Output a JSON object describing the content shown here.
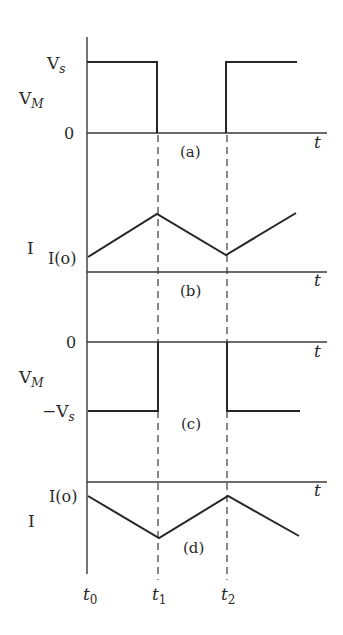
{
  "diagram": {
    "colors": {
      "background": "#ffffff",
      "ink": "#262626"
    },
    "time_markers": [
      {
        "label": "t",
        "sub": "0",
        "x": 88
      },
      {
        "label": "t",
        "sub": "1",
        "x": 158
      },
      {
        "label": "t",
        "sub": "2",
        "x": 227
      }
    ],
    "panels": [
      {
        "id": "a",
        "caption": "(a)",
        "y_label_main": "V",
        "y_label_sub": "M",
        "ticks": [
          {
            "main": "V",
            "sub": "s",
            "y": 62
          },
          {
            "main": "0",
            "sub": "",
            "y": 133
          }
        ],
        "x_axis_label": "t",
        "waveform": "square pulse from 0 to Vs: high on t0–t1, zero on t1–t2, high after t2"
      },
      {
        "id": "b",
        "caption": "(b)",
        "y_label_main": "I",
        "ticks": [
          {
            "main": "I(o)",
            "y": 257
          }
        ],
        "x_axis_label": "t",
        "waveform": "triangular current: rises from I(o) to peak at t1, falls to I(o) at t2, rises again"
      },
      {
        "id": "c",
        "caption": "(c)",
        "y_label_main": "V",
        "y_label_sub": "M",
        "ticks": [
          {
            "main": "0",
            "sub": "",
            "y": 342
          },
          {
            "main": "−V",
            "sub": "s",
            "y": 411
          }
        ],
        "x_axis_label": "t",
        "waveform": "negative square pulse: −Vs on t0–t1, zero on t1–t2, −Vs after t2"
      },
      {
        "id": "d",
        "caption": "(d)",
        "y_label_main": "I",
        "ticks": [
          {
            "main": "I(o)",
            "y": 496
          }
        ],
        "x_axis_label": "t",
        "waveform": "inverted triangular current: falls from I(o) to minimum at t1, rises to I(o) at t2, falls again"
      }
    ]
  }
}
